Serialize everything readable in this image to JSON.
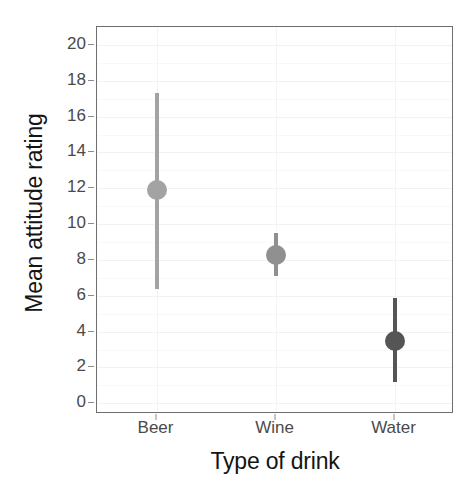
{
  "chart_data": {
    "type": "scatter",
    "title": "",
    "xlabel": "Type of drink",
    "ylabel": "Mean attitude rating",
    "categories": [
      "Beer",
      "Wine",
      "Water"
    ],
    "values": [
      11.9,
      8.3,
      3.5
    ],
    "error_low": [
      6.4,
      7.1,
      1.2
    ],
    "error_high": [
      17.3,
      9.5,
      5.9
    ],
    "ylim": [
      -0.6,
      21.0
    ],
    "yticks": [
      0,
      2,
      4,
      6,
      8,
      10,
      12,
      14,
      16,
      18,
      20
    ],
    "ytick_labels": [
      "0",
      "2",
      "4",
      "6",
      "8",
      "10",
      "12",
      "14",
      "16",
      "18",
      "20"
    ],
    "grid": true,
    "legend": "none",
    "series": [
      {
        "name": "Beer",
        "mean": 11.9,
        "ci_low": 6.4,
        "ci_high": 17.3,
        "point_color": "#a3a3a3",
        "bar_color": "#a3a3a3"
      },
      {
        "name": "Wine",
        "mean": 8.3,
        "ci_low": 7.1,
        "ci_high": 9.5,
        "point_color": "#909090",
        "bar_color": "#909090"
      },
      {
        "name": "Water",
        "mean": 3.5,
        "ci_low": 1.2,
        "ci_high": 5.9,
        "point_color": "#555555",
        "bar_color": "#555555"
      }
    ]
  },
  "axes": {
    "y_title": "Mean attitude rating",
    "x_title": "Type of drink",
    "panel_border_color": "#6e6e6e",
    "tick_color": "#8c8c8c",
    "tick_label_color": "#4a4a4a"
  }
}
